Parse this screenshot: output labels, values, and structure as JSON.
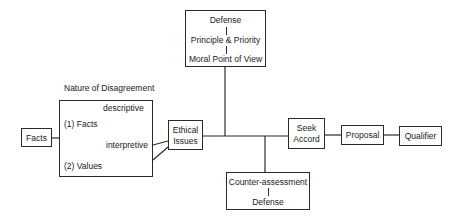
{
  "diagram": {
    "title_label": "Nature of Disagreement",
    "nodes": {
      "facts": {
        "label": "Facts"
      },
      "disagreement": {
        "facts_item": "(1) Facts",
        "descriptive": "descriptive",
        "interpretive": "interpretive",
        "values_item": "(2) Values"
      },
      "ethical_issues": {
        "line1": "Ethical",
        "line2": "Issues"
      },
      "defense_top": {
        "line1": "Defense",
        "line2": "Principle & Priority",
        "line3": "Moral Point of View"
      },
      "counter": {
        "line1": "Counter-assessment",
        "line2": "Defense"
      },
      "seek_accord": {
        "line1": "Seek",
        "line2": "Accord"
      },
      "proposal": {
        "label": "Proposal"
      },
      "qualifier": {
        "label": "Qualifier"
      }
    },
    "colors": {
      "stroke": "#2a2a2a",
      "background": "#ffffff"
    }
  }
}
